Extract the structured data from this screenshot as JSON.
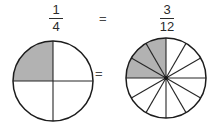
{
  "diagram": {
    "top_equation": {
      "left_fraction": {
        "numerator": "1",
        "denominator": "4"
      },
      "equals": "=",
      "right_fraction": {
        "numerator": "3",
        "denominator": "12"
      }
    },
    "middle_equals": "=",
    "left_pie": {
      "total_slices": 4,
      "shaded_slices": 1,
      "shaded_region": "top-left quadrant"
    },
    "right_pie": {
      "total_slices": 12,
      "shaded_slices": 3,
      "shaded_region": "upper-left sectors from 12 o'clock to 9 o'clock",
      "center_dot": true
    },
    "colors": {
      "background": "#ffffff",
      "shaded_fill": "#b2b2b2",
      "outline": "#1c1c1c",
      "divider_line": "#262626",
      "text": "#2b2b2b"
    }
  }
}
